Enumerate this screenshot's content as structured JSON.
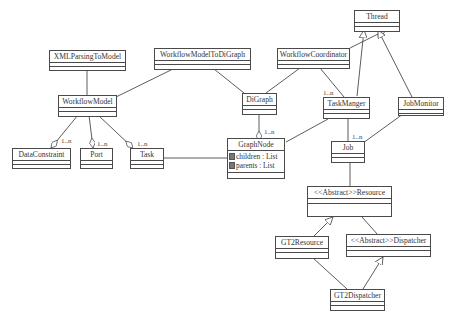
{
  "diagram": {
    "type": "uml-class-diagram",
    "classes": [
      {
        "id": "thread",
        "name": "Thread",
        "attributes": []
      },
      {
        "id": "xmlparsing",
        "name": "XMLParsingToModel",
        "attributes": []
      },
      {
        "id": "wfm2dig",
        "name": "WorkflowModelToDiGraph",
        "attributes": []
      },
      {
        "id": "wfcoord",
        "name": "WorkflowCoordinator",
        "attributes": []
      },
      {
        "id": "wfmodel",
        "name": "WorkflowModel",
        "attributes": []
      },
      {
        "id": "digraph",
        "name": "DiGraph",
        "attributes": []
      },
      {
        "id": "taskmanger",
        "name": "TaskManger",
        "attributes": []
      },
      {
        "id": "jobmonitor",
        "name": "JobMonitor",
        "attributes": []
      },
      {
        "id": "dataconstraint",
        "name": "DataConstraint",
        "attributes": []
      },
      {
        "id": "port",
        "name": "Port",
        "attributes": []
      },
      {
        "id": "task",
        "name": "Task",
        "attributes": []
      },
      {
        "id": "graphnode",
        "name": "GraphNode",
        "attributes": [
          "children : List",
          "parents : List"
        ]
      },
      {
        "id": "job",
        "name": "Job",
        "attributes": []
      },
      {
        "id": "resource",
        "name": "<<Abstract>>Resource",
        "attributes": []
      },
      {
        "id": "gt2resource",
        "name": "GT2Resource",
        "attributes": []
      },
      {
        "id": "dispatcher",
        "name": "<<Abstract>>Dispatcher",
        "attributes": []
      },
      {
        "id": "gt2dispatcher",
        "name": "GT2Dispatcher",
        "attributes": []
      }
    ],
    "relations": [
      {
        "from": "wfcoord",
        "to": "thread",
        "type": "generalization"
      },
      {
        "from": "taskmanger",
        "to": "thread",
        "type": "generalization"
      },
      {
        "from": "jobmonitor",
        "to": "thread",
        "type": "generalization"
      },
      {
        "from": "xmlparsing",
        "to": "wfmodel",
        "type": "association"
      },
      {
        "from": "wfm2dig",
        "to": "wfmodel",
        "type": "association"
      },
      {
        "from": "wfm2dig",
        "to": "digraph",
        "type": "association"
      },
      {
        "from": "wfcoord",
        "to": "digraph",
        "type": "association"
      },
      {
        "from": "wfcoord",
        "to": "taskmanger",
        "type": "association",
        "multiplicity": "1..n"
      },
      {
        "from": "wfmodel",
        "to": "dataconstraint",
        "type": "aggregation",
        "multiplicity": "1..n"
      },
      {
        "from": "wfmodel",
        "to": "port",
        "type": "aggregation",
        "multiplicity": "1..n"
      },
      {
        "from": "wfmodel",
        "to": "task",
        "type": "aggregation",
        "multiplicity": "1..n"
      },
      {
        "from": "digraph",
        "to": "graphnode",
        "type": "aggregation",
        "multiplicity": "1..n"
      },
      {
        "from": "task",
        "to": "graphnode",
        "type": "association"
      },
      {
        "from": "taskmanger",
        "to": "graphnode",
        "type": "association"
      },
      {
        "from": "taskmanger",
        "to": "job",
        "type": "association",
        "multiplicity": "1..n"
      },
      {
        "from": "jobmonitor",
        "to": "job",
        "type": "association"
      },
      {
        "from": "job",
        "to": "resource",
        "type": "association"
      },
      {
        "from": "gt2resource",
        "to": "resource",
        "type": "generalization"
      },
      {
        "from": "resource",
        "to": "dispatcher",
        "type": "association"
      },
      {
        "from": "gt2dispatcher",
        "to": "dispatcher",
        "type": "generalization"
      },
      {
        "from": "gt2resource",
        "to": "gt2dispatcher",
        "type": "association"
      }
    ],
    "multiplicity_labels": {
      "taskmanger": "1..n",
      "dataconstraint": "1..n",
      "port": "1..n",
      "task": "1..n",
      "graphnode": "1..n",
      "job": "1..n"
    }
  }
}
